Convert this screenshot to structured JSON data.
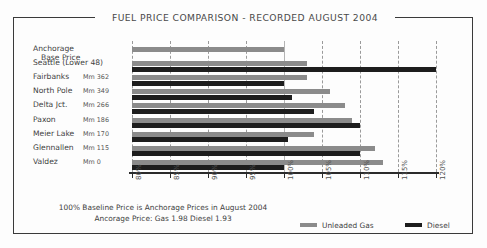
{
  "title": "FUEL PRICE COMPARISON - RECORDED AUGUST 2004",
  "footer": {
    "line1": "100% Baseline Price is Anchorage Prices in August 2004",
    "line2": "Ancorage Price:   Gas 1.98        Diesel 1.93"
  },
  "legend": [
    {
      "label": "Unleaded Gas",
      "color": "#8b8b8b",
      "key": "gas"
    },
    {
      "label": "Diesel",
      "color": "#1d1d1d",
      "key": "diesel"
    }
  ],
  "rows": [
    {
      "name": "Anchorage",
      "name2": "Base Price",
      "mm": ""
    },
    {
      "name": "Seattle (Lower 48)",
      "name2": "",
      "mm": ""
    },
    {
      "name": "Fairbanks",
      "name2": "",
      "mm": "Mm 362"
    },
    {
      "name": "North Pole",
      "name2": "",
      "mm": "Mm 349"
    },
    {
      "name": "Delta Jct.",
      "name2": "",
      "mm": "Mm 266"
    },
    {
      "name": "Paxon",
      "name2": "",
      "mm": "Mm 186"
    },
    {
      "name": "Meier Lake",
      "name2": "",
      "mm": "Mm 170"
    },
    {
      "name": "Glennallen",
      "name2": "",
      "mm": "Mm 115"
    },
    {
      "name": "Valdez",
      "name2": "",
      "mm": "Mm 0"
    }
  ],
  "chart_data": {
    "type": "bar",
    "orientation": "horizontal",
    "title": "FUEL PRICE COMPARISON - RECORDED AUGUST 2004",
    "xlabel": "",
    "ylabel": "",
    "xlim": [
      80,
      120
    ],
    "xticks": [
      "80%",
      "85%",
      "90%",
      "95%",
      "100%",
      "105%",
      "110%",
      "115%",
      "120%"
    ],
    "xtick_values": [
      80,
      85,
      90,
      95,
      100,
      105,
      110,
      115,
      120
    ],
    "grid": true,
    "legend_position": "bottom-right",
    "categories": [
      "Anchorage Base Price",
      "Seattle (Lower 48)",
      "Fairbanks",
      "North Pole",
      "Delta Jct.",
      "Paxon",
      "Meier Lake",
      "Glennallen",
      "Valdez"
    ],
    "series": [
      {
        "name": "Unleaded Gas",
        "color": "#8b8b8b",
        "values": [
          100,
          103,
          103,
          106,
          108,
          109,
          104,
          112,
          113
        ]
      },
      {
        "name": "Diesel",
        "color": "#1d1d1d",
        "values": [
          null,
          120,
          100,
          101,
          104,
          110,
          100.5,
          110,
          100
        ]
      }
    ],
    "annotations": [
      "100% Baseline Price is Anchorage Prices in August 2004",
      "Ancorage Price:   Gas 1.98        Diesel 1.93"
    ]
  }
}
